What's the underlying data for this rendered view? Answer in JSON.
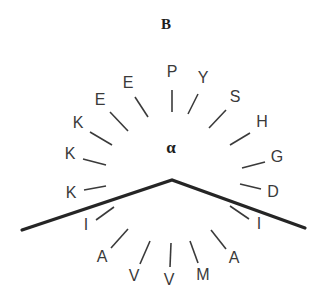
{
  "figure": {
    "panel_label": "B",
    "center_label": "α",
    "center_label_name": "alpha",
    "width": 325,
    "height": 305,
    "background_color": "#ffffff",
    "line_color": "#3a3a3a",
    "chevron_color": "#252525",
    "text_color": "#1d1d1d"
  },
  "panel": {
    "label_x": 166,
    "label_y": 26
  },
  "center": {
    "label_x": 171,
    "label_y": 149,
    "origin_x": 172,
    "origin_y": 180
  },
  "chevron": {
    "points": "22,230 172,180 305,228",
    "left_end_x": 22,
    "left_end_y": 230,
    "apex_x": 172,
    "apex_y": 180,
    "right_end_x": 305,
    "right_end_y": 228
  },
  "chart_data": {
    "type": "scatter",
    "title": "B",
    "subtitle": "",
    "xlabel": "",
    "ylabel": "",
    "center_annotation": "α",
    "grid": false,
    "legend": "none",
    "residues": [
      {
        "label": "E",
        "label_x": 128,
        "label_y": 84,
        "tick_x1": 135,
        "tick_y1": 97,
        "tick_x2": 148,
        "tick_y2": 117
      },
      {
        "label": "P",
        "label_x": 172,
        "label_y": 73,
        "tick_x1": 172,
        "tick_y1": 90,
        "tick_x2": 172,
        "tick_y2": 112
      },
      {
        "label": "Y",
        "label_x": 203,
        "label_y": 79,
        "tick_x1": 198,
        "tick_y1": 94,
        "tick_x2": 188,
        "tick_y2": 114
      },
      {
        "label": "E",
        "label_x": 100,
        "label_y": 101,
        "tick_x1": 110,
        "tick_y1": 112,
        "tick_x2": 128,
        "tick_y2": 131
      },
      {
        "label": "S",
        "label_x": 235,
        "label_y": 98,
        "tick_x1": 226,
        "tick_y1": 110,
        "tick_x2": 209,
        "tick_y2": 128
      },
      {
        "label": "K",
        "label_x": 78,
        "label_y": 124,
        "tick_x1": 90,
        "tick_y1": 132,
        "tick_x2": 112,
        "tick_y2": 145
      },
      {
        "label": "H",
        "label_x": 262,
        "label_y": 123,
        "tick_x1": 250,
        "tick_y1": 133,
        "tick_x2": 230,
        "tick_y2": 145
      },
      {
        "label": "K",
        "label_x": 70,
        "label_y": 155,
        "tick_x1": 83,
        "tick_y1": 159,
        "tick_x2": 106,
        "tick_y2": 165
      },
      {
        "label": "G",
        "label_x": 277,
        "label_y": 158,
        "tick_x1": 265,
        "tick_y1": 162,
        "tick_x2": 242,
        "tick_y2": 168
      },
      {
        "label": "K",
        "label_x": 71,
        "label_y": 194,
        "tick_x1": 84,
        "tick_y1": 190,
        "tick_x2": 106,
        "tick_y2": 186
      },
      {
        "label": "D",
        "label_x": 273,
        "label_y": 193,
        "tick_x1": 261,
        "tick_y1": 189,
        "tick_x2": 240,
        "tick_y2": 184
      },
      {
        "label": "I",
        "label_x": 86,
        "label_y": 226,
        "tick_x1": 96,
        "tick_y1": 220,
        "tick_x2": 114,
        "tick_y2": 207
      },
      {
        "label": "I",
        "label_x": 259,
        "label_y": 225,
        "tick_x1": 249,
        "tick_y1": 219,
        "tick_x2": 230,
        "tick_y2": 206
      },
      {
        "label": "A",
        "label_x": 102,
        "label_y": 258,
        "tick_x1": 111,
        "tick_y1": 248,
        "tick_x2": 128,
        "tick_y2": 229
      },
      {
        "label": "A",
        "label_x": 234,
        "label_y": 259,
        "tick_x1": 226,
        "tick_y1": 249,
        "tick_x2": 211,
        "tick_y2": 230
      },
      {
        "label": "V",
        "label_x": 134,
        "label_y": 277,
        "tick_x1": 140,
        "tick_y1": 264,
        "tick_x2": 150,
        "tick_y2": 241
      },
      {
        "label": "V",
        "label_x": 169,
        "label_y": 281,
        "tick_x1": 170,
        "tick_y1": 267,
        "tick_x2": 171,
        "tick_y2": 243
      },
      {
        "label": "M",
        "label_x": 203,
        "label_y": 276,
        "tick_x1": 198,
        "tick_y1": 263,
        "tick_x2": 190,
        "tick_y2": 241
      }
    ],
    "sequence": [
      "E",
      "P",
      "Y",
      "E",
      "S",
      "K",
      "H",
      "K",
      "G",
      "K",
      "D",
      "I",
      "I",
      "A",
      "A",
      "V",
      "V",
      "M"
    ]
  }
}
